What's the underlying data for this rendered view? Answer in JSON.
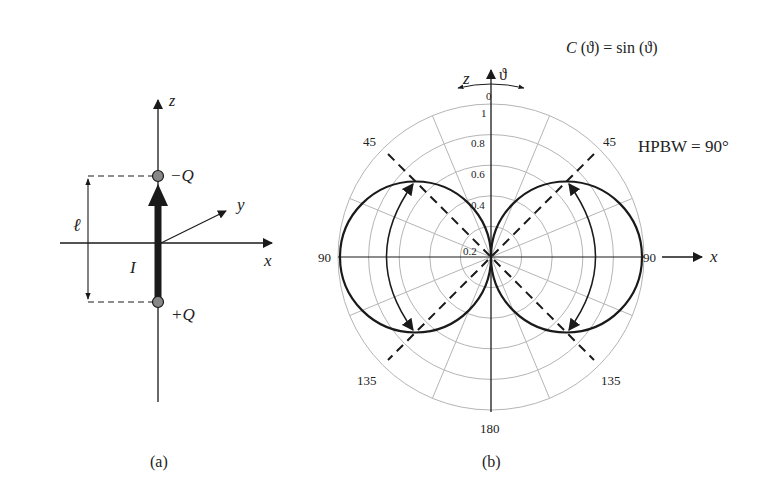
{
  "panel_a": {
    "caption": "(a)",
    "axis_z": "z",
    "axis_x": "x",
    "axis_y": "y",
    "charge_top": "−Q",
    "charge_bottom": "+Q",
    "length_label": "ℓ",
    "current_label": "I"
  },
  "panel_b": {
    "caption": "(b)",
    "axis_z": "z",
    "axis_x": "x",
    "theta": "ϑ",
    "formula": "C (ϑ) = sin (ϑ)",
    "hpbw": "HPBW = 90°",
    "angle_labels": {
      "top": "0",
      "left": "90",
      "right": "90",
      "bottom": "180",
      "ul": "45",
      "ur": "45",
      "ll": "135",
      "lr": "135"
    },
    "radial_labels": [
      "0.2",
      "0.4",
      "0.6",
      "0.8",
      "1"
    ]
  },
  "colors": {
    "ink": "#1a1a1a",
    "grid": "#b5b5b5"
  }
}
